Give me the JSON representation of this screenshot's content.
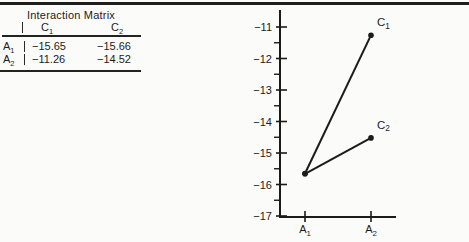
{
  "colors": {
    "ink": "#1b1b1b",
    "paper": "#fbfbf9"
  },
  "table": {
    "title": "Interaction Matrix",
    "columns": [
      {
        "base": "C",
        "sub": "1"
      },
      {
        "base": "C",
        "sub": "2"
      }
    ],
    "rows": [
      {
        "label": {
          "base": "A",
          "sub": "1"
        },
        "values": [
          "−15.65",
          "−15.66"
        ]
      },
      {
        "label": {
          "base": "A",
          "sub": "2"
        },
        "values": [
          "−11.26",
          "−14.52"
        ]
      }
    ]
  },
  "chart_data": {
    "type": "line",
    "title": "",
    "xlabel": "",
    "ylabel": "",
    "categories": [
      {
        "base": "A",
        "sub": "1"
      },
      {
        "base": "A",
        "sub": "2"
      }
    ],
    "series": [
      {
        "name": {
          "base": "C",
          "sub": "1"
        },
        "values": [
          -15.65,
          -11.26
        ]
      },
      {
        "name": {
          "base": "C",
          "sub": "2"
        },
        "values": [
          -15.66,
          -14.52
        ]
      }
    ],
    "ylim": [
      -17,
      -11
    ],
    "yticks": [
      -11,
      -12,
      -13,
      -14,
      -15,
      -16,
      -17
    ],
    "ytick_labels": [
      "−11",
      "−12",
      "−13",
      "−14",
      "−15",
      "−16",
      "−17"
    ],
    "minor_yticks": [
      -11.5,
      -12.5,
      -13.5,
      -14.5,
      -15.5,
      -16.5
    ],
    "grid": false,
    "legend": "inline-point-labels",
    "marker": "filled-circle"
  }
}
